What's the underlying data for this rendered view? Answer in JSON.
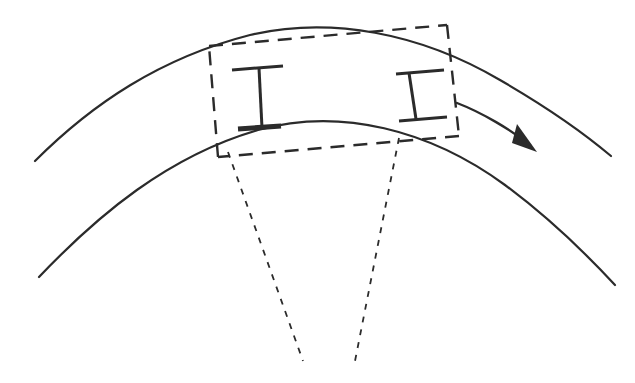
{
  "figure": {
    "type": "technical-line-drawing",
    "background_color": "#ffffff",
    "ink_color": "#2b2b2b",
    "canvas": {
      "width": 635,
      "height": 383
    }
  },
  "style": {
    "arc_stroke_width": 2.2,
    "dash_box_stroke_width": 2.4,
    "dash_box_pattern": "14 9",
    "radial_stroke_width": 1.8,
    "radial_pattern": "6 7",
    "beam_stroke_width": 3.0,
    "beam_flange_stroke_width": 3.0,
    "arrow_stroke_width": 2.4
  },
  "elements": {
    "outer_arc": {
      "name": "outer curved surface",
      "path": "M 35 161 C 92 104 160 58 250 35 C 330 16 420 33 500 80 C 545 106 585 134 611 156",
      "color": "#2b2b2b"
    },
    "inner_arc": {
      "name": "inner curved surface",
      "path": "M 39 277 C 98 215 168 156 258 130 C 340 107 430 130 505 185 C 552 220 590 258 615 285",
      "color": "#2b2b2b"
    },
    "dashed_box": {
      "name": "dashed measurement envelope",
      "corners": {
        "top_left": [
          209,
          46
        ],
        "top_right": [
          447,
          25
        ],
        "bottom_right": [
          459,
          136
        ],
        "bottom_left": [
          218,
          157
        ]
      },
      "color": "#2b2b2b"
    },
    "radial_lines": [
      {
        "name": "left radial construction line",
        "from": [
          228,
          152
        ],
        "to": [
          303,
          361
        ]
      },
      {
        "name": "right radial construction line",
        "from": [
          399,
          138
        ],
        "to": [
          355,
          361
        ]
      }
    ],
    "beams": [
      {
        "name": "left thickness caliper",
        "top_cap": {
          "from": [
            232,
            70
          ],
          "to": [
            283,
            66
          ]
        },
        "stem": {
          "from": [
            259,
            68
          ],
          "to": [
            262,
            128
          ]
        },
        "bottom_flange": {
          "from": [
            238,
            129
          ],
          "to": [
            281,
            126
          ]
        },
        "bottom_flange_thick": true
      },
      {
        "name": "right thickness caliper",
        "top_cap": {
          "from": [
            396,
            74
          ],
          "to": [
            444,
            70
          ]
        },
        "stem": {
          "from": [
            409,
            73
          ],
          "to": [
            416,
            119
          ]
        },
        "bottom_cap": {
          "from": [
            399,
            121
          ],
          "to": [
            447,
            117
          ]
        },
        "bottom_flange_thick": false
      }
    ],
    "direction_arrow": {
      "name": "direction of travel arrow",
      "shaft_path": "M 457 103 C 483 113 511 130 530 145",
      "head_points": "537 152 512 143 517 124",
      "color": "#2b2b2b"
    }
  }
}
